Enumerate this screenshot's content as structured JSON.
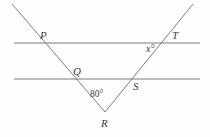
{
  "figure": {
    "background_color": "#fefefe",
    "line_color": "#6d6d6d",
    "label_color": "#3a3a3a",
    "labels": {
      "p": "P",
      "t": "T",
      "q": "Q",
      "s": "S",
      "r": "R",
      "x_angle": "x°",
      "interior_angle": "80°"
    },
    "geometry": {
      "parallel_line_top": {
        "x1": 14,
        "y1": 43,
        "x2": 200,
        "y2": 43
      },
      "parallel_line_bottom": {
        "x1": 14,
        "y1": 79,
        "x2": 200,
        "y2": 79
      },
      "transversal_left": {
        "x1": 12,
        "y1": 4,
        "x2": 105,
        "y2": 112
      },
      "transversal_right": {
        "x1": 105,
        "y1": 112,
        "x2": 193,
        "y2": 4
      },
      "vertex_r": {
        "x": 105,
        "y": 112
      },
      "intersection_p": {
        "x": 45,
        "y": 43
      },
      "intersection_q": {
        "x": 76,
        "y": 79
      },
      "intersection_s": {
        "x": 134,
        "y": 79
      },
      "intersection_t": {
        "x": 166,
        "y": 43
      }
    }
  }
}
